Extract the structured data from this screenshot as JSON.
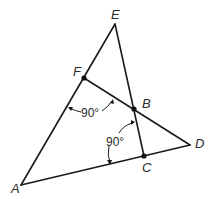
{
  "figure": {
    "type": "geometry",
    "points": {
      "A": {
        "label": "A",
        "x": 21,
        "y": 185,
        "dot": false
      },
      "E": {
        "label": "E",
        "x": 115,
        "y": 24,
        "dot": false
      },
      "D": {
        "label": "D",
        "x": 190,
        "y": 145,
        "dot": false
      },
      "F": {
        "label": "F",
        "x": 84,
        "y": 78,
        "dot": true
      },
      "B": {
        "label": "B",
        "x": 134,
        "y": 109,
        "dot": true
      },
      "C": {
        "label": "C",
        "x": 144,
        "y": 156,
        "dot": true
      }
    },
    "segments": [
      [
        "A",
        "E"
      ],
      [
        "A",
        "D"
      ],
      [
        "E",
        "C"
      ],
      [
        "F",
        "D"
      ]
    ],
    "angle_marks": [
      {
        "text": "90°",
        "between": [
          "AF",
          "FB"
        ],
        "at": "F"
      },
      {
        "text": "90°",
        "between": [
          "BC",
          "CA"
        ],
        "at": "C"
      }
    ]
  }
}
